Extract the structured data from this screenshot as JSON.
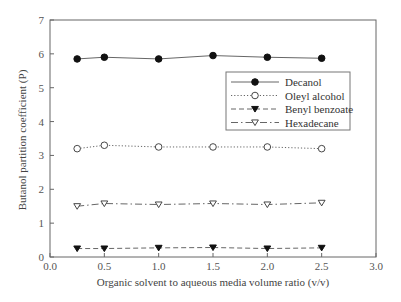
{
  "chart_data": {
    "type": "line",
    "title": "",
    "xlabel": "Organic solvent to aqueous media volume ratio (v/v)",
    "ylabel": "Butanol partition coefficient (P)",
    "xlim": [
      0.0,
      3.0
    ],
    "ylim": [
      0,
      7
    ],
    "xticks": [
      "0.0",
      "0.5",
      "1.0",
      "1.5",
      "2.0",
      "2.5",
      "3.0"
    ],
    "yticks": [
      "0",
      "1",
      "2",
      "3",
      "4",
      "5",
      "6",
      "7"
    ],
    "grid": false,
    "legend_position": "upper right",
    "x": [
      0.25,
      0.5,
      1.0,
      1.5,
      2.0,
      2.5
    ],
    "series": [
      {
        "name": "Decanol",
        "marker": "filled-circle",
        "line": "solid",
        "values": [
          5.85,
          5.9,
          5.85,
          5.95,
          5.9,
          5.87
        ]
      },
      {
        "name": "Oleyl alcohol",
        "marker": "open-circle",
        "line": "dotted",
        "values": [
          3.2,
          3.3,
          3.25,
          3.25,
          3.25,
          3.2
        ]
      },
      {
        "name": "Benyl benzoate",
        "marker": "filled-triangle-down",
        "line": "dashed",
        "values": [
          0.25,
          0.25,
          0.27,
          0.28,
          0.25,
          0.27
        ]
      },
      {
        "name": "Hexadecane",
        "marker": "open-triangle-down",
        "line": "dash-dot",
        "values": [
          1.5,
          1.58,
          1.55,
          1.58,
          1.55,
          1.6
        ]
      }
    ]
  }
}
